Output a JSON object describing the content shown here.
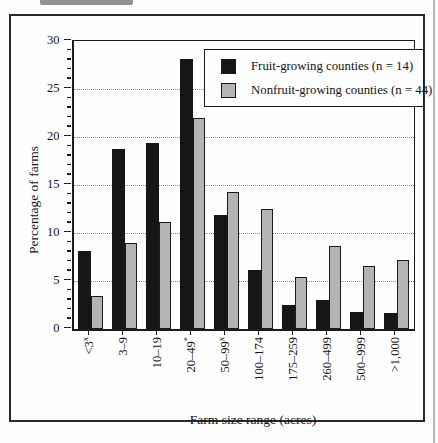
{
  "figure": {
    "background": "#fdfdfd",
    "frame_color": "#2a2a2a"
  },
  "chart_data": {
    "type": "bar",
    "title": "",
    "xlabel": "Farm size range (acres)",
    "ylabel": "Percentage of farms",
    "ylim": [
      0,
      30
    ],
    "yticks": [
      0,
      5,
      10,
      15,
      20,
      25,
      30
    ],
    "y_minor_tick_step": 1,
    "grid": "horizontal dotted lines at major y ticks (5,10,15,20,25)",
    "legend_position": "top-right inside plot, boxed",
    "categories": [
      {
        "label": "<3",
        "sup": "x"
      },
      {
        "label": "3–9",
        "sup": ""
      },
      {
        "label": "10–19",
        "sup": ""
      },
      {
        "label": "20–49",
        "sup": "*"
      },
      {
        "label": "50–99",
        "sup": "x"
      },
      {
        "label": "100–174",
        "sup": ""
      },
      {
        "label": "175–259",
        "sup": ""
      },
      {
        "label": "260–499",
        "sup": ""
      },
      {
        "label": "500–999",
        "sup": ""
      },
      {
        "label": ">1,000",
        "sup": ""
      }
    ],
    "series": [
      {
        "name": "Fruit-growing counties (n = 14)",
        "color": "#161616",
        "values": [
          8.1,
          18.7,
          19.3,
          28.1,
          11.8,
          6.1,
          2.5,
          3.0,
          1.7,
          1.6
        ]
      },
      {
        "name": "Nonfruit-growing counties (n = 44)",
        "color": "#b4b4b4",
        "values": [
          3.4,
          8.9,
          11.1,
          21.9,
          14.2,
          12.4,
          5.4,
          8.6,
          6.5,
          7.1
        ]
      }
    ]
  }
}
